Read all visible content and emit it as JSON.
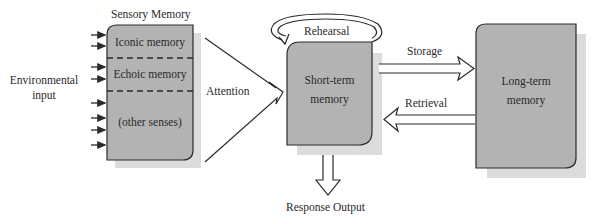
{
  "diagram": {
    "colors": {
      "box_fill": "#b3b3b3",
      "shadow": "#dcdcdc",
      "stroke": "#2a2a2a",
      "background": "#ffffff"
    },
    "input": {
      "label_line1": "Environmental",
      "label_line2": "input",
      "arrow_count": 8
    },
    "sensory_memory": {
      "title": "Sensory Memory",
      "sections": [
        {
          "label": "Iconic memory"
        },
        {
          "label": "Echoic memory"
        },
        {
          "label": "(other senses)"
        }
      ]
    },
    "attention": {
      "label": "Attention"
    },
    "short_term_memory": {
      "label_line1": "Short-term",
      "label_line2": "memory"
    },
    "rehearsal": {
      "label": "Rehearsal"
    },
    "storage": {
      "label": "Storage"
    },
    "retrieval": {
      "label": "Retrieval"
    },
    "long_term_memory": {
      "label_line1": "Long-term",
      "label_line2": "memory"
    },
    "response": {
      "label": "Response Output"
    }
  }
}
